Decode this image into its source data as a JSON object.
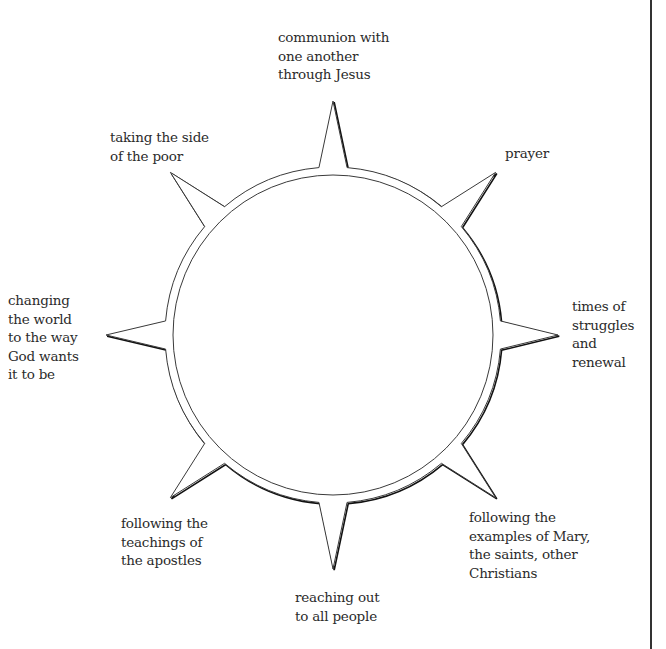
{
  "diagram": {
    "title": "",
    "center": {
      "x": 333,
      "y": 335
    },
    "outer_radius": 168,
    "inner_radius": 160,
    "stroke_color": "#3a3a3a",
    "shadow_color": "#111111",
    "spikes": [
      {
        "name": "top",
        "angle_deg": -90,
        "tip_distance": 234
      },
      {
        "name": "upper-right",
        "angle_deg": -45,
        "tip_distance": 230
      },
      {
        "name": "right",
        "angle_deg": 0,
        "tip_distance": 225
      },
      {
        "name": "lower-right",
        "angle_deg": 45,
        "tip_distance": 230
      },
      {
        "name": "bottom",
        "angle_deg": 90,
        "tip_distance": 234
      },
      {
        "name": "lower-left",
        "angle_deg": 135,
        "tip_distance": 230
      },
      {
        "name": "left",
        "angle_deg": 180,
        "tip_distance": 227
      },
      {
        "name": "upper-left",
        "angle_deg": 225,
        "tip_distance": 230
      }
    ],
    "labels": {
      "top": "communion with\none another\nthrough Jesus",
      "upper_right": "prayer",
      "right": "times of\nstruggles\nand\nrenewal",
      "lower_right": "following the\nexamples of Mary,\nthe saints, other\nChristians",
      "bottom": "reaching out\nto all people",
      "lower_left": "following the\nteachings of\nthe apostles",
      "left": "changing\nthe world\nto the way\nGod wants\nit to be",
      "upper_left": "taking the side\nof the poor"
    }
  }
}
